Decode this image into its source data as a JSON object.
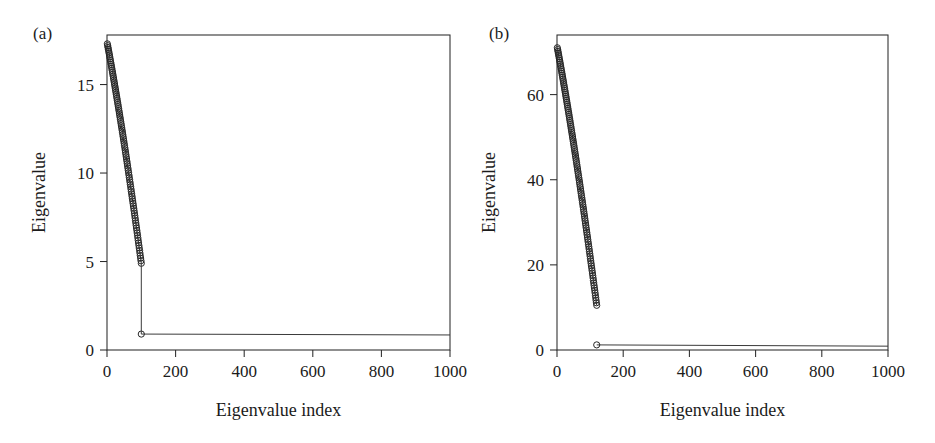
{
  "figure": {
    "background_color": "#ffffff",
    "ink_color": "#262626",
    "panels": [
      "a",
      "b"
    ]
  },
  "chart_data": [
    {
      "panel_label": "(a)",
      "type": "scatter",
      "title": "",
      "xlabel": "Eigenvalue index",
      "ylabel": "Eigenvalue",
      "xlim": [
        0,
        1000
      ],
      "ylim": [
        0,
        17.8
      ],
      "xticks": [
        0,
        200,
        400,
        600,
        800,
        1000
      ],
      "xticklabels": [
        "0",
        "200",
        "400",
        "600",
        "800",
        "1000"
      ],
      "yticks": [
        0,
        5,
        10,
        15
      ],
      "yticklabels": [
        "0",
        "5",
        "10",
        "15"
      ],
      "grid": false,
      "legend": "none",
      "marker": "open-circle",
      "marker_size": 3.1,
      "series": [
        {
          "name": "signal eigenvalues",
          "description": "First 100 eigenvalues decreasing steeply from about 17.3 to about 4.9",
          "x_start": 1,
          "x_end": 100,
          "y_start": 17.3,
          "y_end": 4.9,
          "n_points": 100,
          "curve": "convex-decay",
          "curvature": 0.38
        },
        {
          "name": "noise eigenvalues",
          "description": "Flat tail of eigenvalues at about 0.9 from index 100 to 1000",
          "x_start": 100,
          "x_end": 1000,
          "y_start": 0.9,
          "y_end": 0.85,
          "n_points": 2,
          "curve": "flat",
          "marker_first_only": true
        }
      ],
      "connector": {
        "description": "Vertical drop from last signal eigenvalue to the noise floor",
        "x": 100,
        "y_top": 4.9,
        "y_bottom": 0.9
      }
    },
    {
      "panel_label": "(b)",
      "type": "scatter",
      "title": "",
      "xlabel": "Eigenvalue index",
      "ylabel": "Eigenvalue",
      "xlim": [
        0,
        1000
      ],
      "ylim": [
        0,
        74
      ],
      "xticks": [
        0,
        200,
        400,
        600,
        800,
        1000
      ],
      "xticklabels": [
        "0",
        "200",
        "400",
        "600",
        "800",
        "1000"
      ],
      "yticks": [
        0,
        20,
        40,
        60
      ],
      "yticklabels": [
        "0",
        "20",
        "40",
        "60"
      ],
      "grid": false,
      "legend": "none",
      "marker": "open-circle",
      "marker_size": 3.1,
      "series": [
        {
          "name": "signal eigenvalues",
          "description": "First 120 eigenvalues decreasing steeply from about 71 to about 10.5",
          "x_start": 1,
          "x_end": 120,
          "y_start": 71.0,
          "y_end": 10.5,
          "n_points": 120,
          "curve": "convex-decay",
          "curvature": 0.3
        },
        {
          "name": "noise eigenvalues",
          "description": "Flat tail of eigenvalues at about 1.2 from index 120 to 1000",
          "x_start": 120,
          "x_end": 1000,
          "y_start": 1.2,
          "y_end": 0.9,
          "n_points": 2,
          "curve": "flat",
          "marker_first_only": true
        }
      ],
      "connector": null
    }
  ]
}
